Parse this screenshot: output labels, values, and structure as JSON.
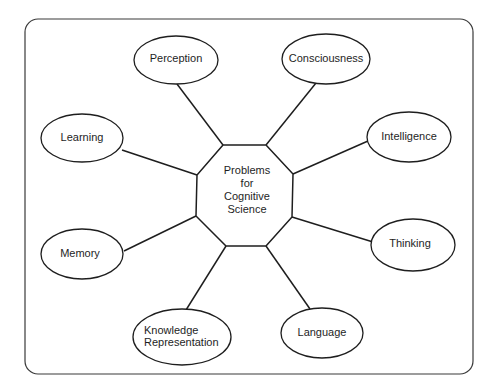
{
  "diagram": {
    "type": "hub-and-spoke concept map",
    "frame": {
      "x": 25,
      "y": 19,
      "width": 448,
      "height": 355,
      "radius": 13
    },
    "colors": {
      "stroke": "#1e1e1e",
      "frame_stroke": "#3a3a3a",
      "fill": "#ffffff",
      "text": "#1e1e1e"
    },
    "center": {
      "shape": "octagon",
      "label_lines": [
        "Problems",
        "for",
        "Cognitive",
        "Science"
      ],
      "points": [
        [
          223,
          145
        ],
        [
          266,
          145
        ],
        [
          293,
          174
        ],
        [
          292,
          217
        ],
        [
          266,
          246
        ],
        [
          226,
          246
        ],
        [
          196,
          216
        ],
        [
          197,
          175
        ]
      ],
      "label_x": 247,
      "label_y": [
        174,
        187,
        200,
        213
      ]
    },
    "nodes": [
      {
        "id": "perception",
        "label_lines": [
          "Perception"
        ],
        "cx": 176,
        "cy": 60,
        "rx": 42,
        "ry": 24,
        "text_anchor": "middle",
        "tx": 176,
        "ty": [
          62
        ],
        "edge": [
          177,
          84,
          223,
          145
        ]
      },
      {
        "id": "consciousness",
        "label_lines": [
          "Consciousness"
        ],
        "cx": 326,
        "cy": 59,
        "rx": 44,
        "ry": 25,
        "text_anchor": "middle",
        "tx": 326,
        "ty": [
          62
        ],
        "edge": [
          316,
          83,
          266,
          145
        ]
      },
      {
        "id": "intelligence",
        "label_lines": [
          "Intelligence"
        ],
        "cx": 409,
        "cy": 137,
        "rx": 42,
        "ry": 25,
        "text_anchor": "middle",
        "tx": 409,
        "ty": [
          140
        ],
        "edge": [
          368,
          141,
          293,
          174
        ]
      },
      {
        "id": "thinking",
        "label_lines": [
          "Thinking"
        ],
        "cx": 413,
        "cy": 245,
        "rx": 42,
        "ry": 26,
        "text_anchor": "middle",
        "tx": 410,
        "ty": [
          247
        ],
        "edge": [
          373,
          242,
          292,
          217
        ]
      },
      {
        "id": "language",
        "label_lines": [
          "Language"
        ],
        "cx": 322,
        "cy": 333,
        "rx": 41,
        "ry": 25,
        "text_anchor": "middle",
        "tx": 322,
        "ty": [
          336
        ],
        "edge": [
          310,
          309,
          266,
          246
        ]
      },
      {
        "id": "knowledge-representation",
        "label_lines": [
          "Knowledge",
          "Representation"
        ],
        "cx": 182,
        "cy": 337,
        "rx": 49,
        "ry": 28,
        "text_anchor": "start",
        "tx": 144,
        "ty": [
          334,
          346
        ],
        "edge": [
          186,
          310,
          226,
          246
        ]
      },
      {
        "id": "memory",
        "label_lines": [
          "Memory"
        ],
        "cx": 82,
        "cy": 254,
        "rx": 41,
        "ry": 25,
        "text_anchor": "middle",
        "tx": 80,
        "ty": [
          257
        ],
        "edge": [
          124,
          251,
          196,
          216
        ]
      },
      {
        "id": "learning",
        "label_lines": [
          "Learning"
        ],
        "cx": 82,
        "cy": 138,
        "rx": 41,
        "ry": 24,
        "text_anchor": "middle",
        "tx": 82,
        "ty": [
          141
        ],
        "edge": [
          122,
          150,
          197,
          175
        ]
      }
    ]
  }
}
